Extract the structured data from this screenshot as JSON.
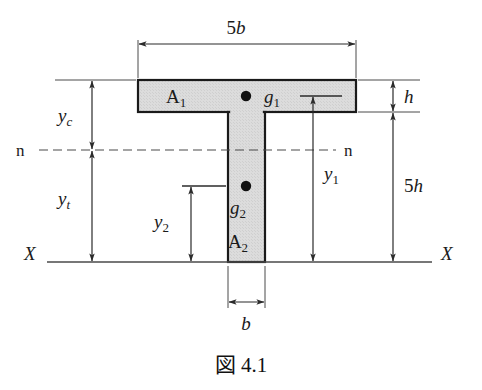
{
  "figure": {
    "caption": "図 4.1",
    "caption_symbol": "図",
    "caption_number": "4.1",
    "section_fill_color": "#d9d9d9",
    "outline_color": "#1a1a1a",
    "line_color": "#3a3a3a",
    "background_color": "#ffffff"
  },
  "shape": {
    "name": "T-section",
    "flange": {
      "area_label": "A",
      "area_sub": "1",
      "centroid_label": "g",
      "centroid_sub": "1"
    },
    "web": {
      "area_label": "A",
      "area_sub": "2",
      "centroid_label": "g",
      "centroid_sub": "2"
    }
  },
  "dimensions": {
    "top_width": {
      "value": "5",
      "symbol": "b",
      "text": "5b"
    },
    "web_width": {
      "value": "",
      "symbol": "b",
      "text": "b"
    },
    "flange_thickness": {
      "value": "",
      "symbol": "h",
      "text": "h"
    },
    "total_depth": {
      "value": "5",
      "symbol": "h",
      "text": "5h"
    },
    "y_c": {
      "symbol": "y",
      "sub": "c",
      "text": "yc"
    },
    "y_t": {
      "symbol": "y",
      "sub": "t",
      "text": "yt"
    },
    "y_1": {
      "symbol": "y",
      "sub": "1",
      "text": "y1"
    },
    "y_2": {
      "symbol": "y",
      "sub": "2",
      "text": "y2"
    }
  },
  "axes": {
    "neutral_axis_left_label": "n",
    "neutral_axis_right_label": "n",
    "reference_axis_left_label": "X",
    "reference_axis_right_label": "X"
  }
}
